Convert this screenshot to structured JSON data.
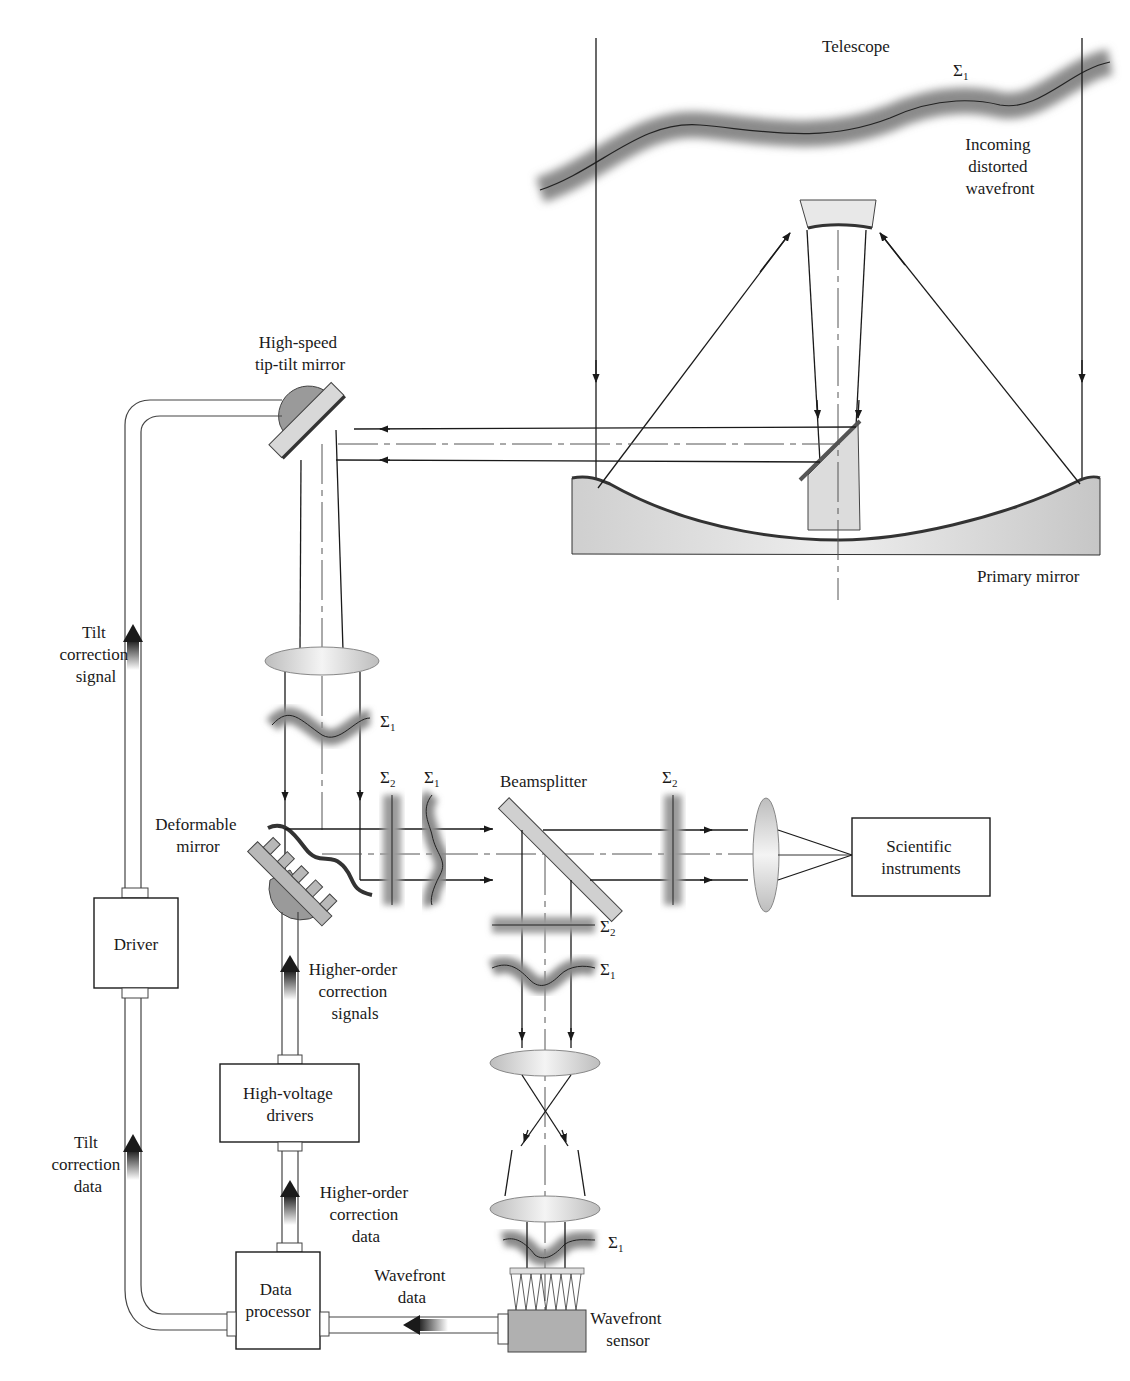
{
  "labels": {
    "telescope": "Telescope",
    "sigma1": "Σ",
    "sigma2": "Σ",
    "sub1": "1",
    "sub2": "2",
    "incoming": [
      "Incoming",
      "distorted",
      "wavefront"
    ],
    "primary_mirror": "Primary mirror",
    "tip_tilt_mirror": [
      "High-speed",
      "tip-tilt mirror"
    ],
    "tilt_correction_signal": [
      "Tilt",
      "correction",
      "signal"
    ],
    "deformable_mirror": [
      "Deformable",
      "mirror"
    ],
    "beamsplitter": "Beamsplitter",
    "scientific_instruments": [
      "Scientific",
      "instruments"
    ],
    "driver": "Driver",
    "higher_order_signals": [
      "Higher-order",
      "correction",
      "signals"
    ],
    "high_voltage_drivers": [
      "High-voltage",
      "drivers"
    ],
    "tilt_correction_data": [
      "Tilt",
      "correction",
      "data"
    ],
    "higher_order_data": [
      "Higher-order",
      "correction",
      "data"
    ],
    "data_processor": [
      "Data",
      "processor"
    ],
    "wavefront_data": [
      "Wavefront",
      "data"
    ],
    "wavefront_sensor": [
      "Wavefront",
      "sensor"
    ]
  },
  "colors": {
    "ink": "#1a1a1a",
    "shade": "#9a9a9a",
    "light_shade": "#d4d4d4",
    "background": "#ffffff"
  }
}
